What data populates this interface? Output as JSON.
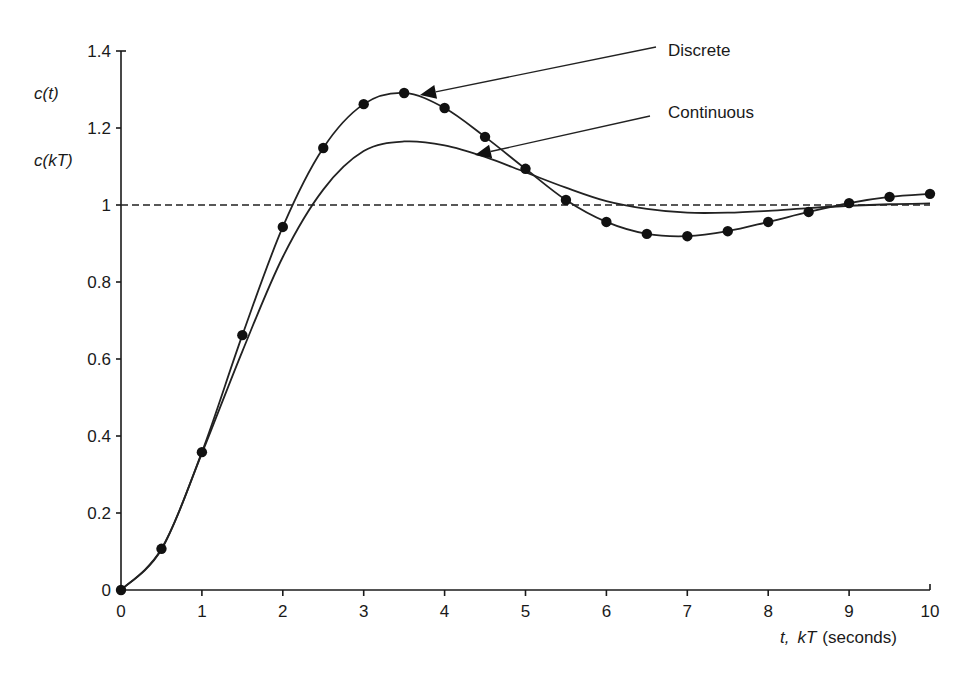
{
  "chart_data": {
    "type": "line",
    "title": "",
    "xlabel": "t, kT (seconds)",
    "xlabel_parts": {
      "t": "t,",
      "kT": "kT",
      "unit": "(seconds)"
    },
    "ylabel": [
      "c(t)",
      "c(kT)"
    ],
    "xlim": [
      0,
      10
    ],
    "ylim": [
      0,
      1.4
    ],
    "x_ticks": [
      0,
      1,
      2,
      3,
      4,
      5,
      6,
      7,
      8,
      9,
      10
    ],
    "x_tick_labels": [
      "0",
      "1",
      "2",
      "3",
      "4",
      "5",
      "6",
      "7",
      "8",
      "9",
      "10"
    ],
    "y_ticks": [
      0,
      0.2,
      0.4,
      0.6,
      0.8,
      1,
      1.2,
      1.4
    ],
    "y_tick_labels": [
      "0",
      "0.2",
      "0.4",
      "0.6",
      "0.8",
      "1",
      "1.2",
      "1.4"
    ],
    "grid": false,
    "reference_line": {
      "y": 1.0,
      "style": "dashed"
    },
    "series": [
      {
        "name": "Discrete",
        "style": "line-with-markers",
        "x": [
          0,
          0.5,
          1.0,
          1.5,
          2.0,
          2.5,
          3.0,
          3.5,
          4.0,
          4.5,
          5.0,
          5.5,
          6.0,
          6.5,
          7.0,
          7.5,
          8.0,
          8.5,
          9.0,
          9.5,
          10.0
        ],
        "values": [
          0,
          0.107,
          0.358,
          0.662,
          0.943,
          1.148,
          1.262,
          1.291,
          1.252,
          1.177,
          1.094,
          1.013,
          0.956,
          0.925,
          0.919,
          0.932,
          0.956,
          0.982,
          1.005,
          1.021,
          1.029
        ]
      },
      {
        "name": "Continuous",
        "style": "line",
        "x": [
          0,
          0.5,
          1.0,
          1.5,
          2.0,
          2.5,
          3.0,
          3.5,
          4.0,
          4.5,
          5.0,
          5.5,
          6.0,
          6.5,
          7.0,
          7.5,
          8.0,
          8.5,
          9.0,
          9.5,
          10.0
        ],
        "values": [
          0,
          0.105,
          0.355,
          0.62,
          0.865,
          1.04,
          1.14,
          1.165,
          1.155,
          1.125,
          1.085,
          1.045,
          1.01,
          0.99,
          0.98,
          0.98,
          0.985,
          0.992,
          0.998,
          1.002,
          1.004
        ]
      }
    ],
    "annotations": [
      {
        "text": "Discrete",
        "label_pos": [
          668,
          56
        ],
        "line_from": [
          656,
          47
        ],
        "arrow_tip": [
          420,
          95
        ]
      },
      {
        "text": "Continuous",
        "label_pos": [
          668,
          118
        ],
        "line_from": [
          650,
          116
        ],
        "arrow_tip": [
          475,
          155
        ]
      }
    ]
  },
  "layout": {
    "plot_left": 121,
    "plot_right": 930,
    "plot_bottom": 590,
    "plot_top": 51
  }
}
